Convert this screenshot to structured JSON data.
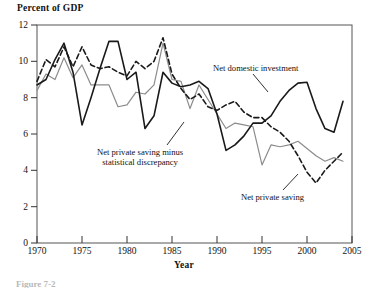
{
  "figure": {
    "caption_stub": "Figure 7-2"
  },
  "chart_data": {
    "type": "line",
    "title": "",
    "ylabel": "Percent of  GDP",
    "xlabel": "Year",
    "xlim": [
      1970,
      2005
    ],
    "ylim": [
      0,
      12
    ],
    "grid": false,
    "legend": "inline-annotations",
    "xticks": [
      "1970",
      "1975",
      "1980",
      "1985",
      "1990",
      "1995",
      "2000",
      "2005"
    ],
    "yticks": [
      "0",
      "2",
      "4",
      "6",
      "8",
      "10",
      "12"
    ],
    "x": [
      1970,
      1971,
      1972,
      1973,
      1974,
      1975,
      1976,
      1977,
      1978,
      1979,
      1980,
      1981,
      1982,
      1983,
      1984,
      1985,
      1986,
      1987,
      1988,
      1989,
      1990,
      1991,
      1992,
      1993,
      1994,
      1995,
      1996,
      1997,
      1998,
      1999,
      2000,
      2001,
      2002,
      2003,
      2004
    ],
    "series": [
      {
        "name": "Net domestic investment",
        "style": "solid",
        "color": "#1a1a1a",
        "width": 1.6,
        "annotation": "Net domestic investment",
        "values": [
          8.7,
          9.0,
          10.1,
          11.0,
          9.4,
          6.5,
          8.0,
          9.6,
          11.1,
          11.1,
          9.0,
          9.4,
          6.3,
          7.0,
          9.4,
          8.8,
          8.6,
          8.7,
          8.9,
          8.5,
          7.1,
          5.1,
          5.4,
          5.9,
          6.6,
          6.6,
          7.0,
          7.8,
          8.4,
          8.8,
          8.85,
          7.4,
          6.3,
          6.1,
          7.8
        ]
      },
      {
        "name": "Net private saving",
        "style": "dashed",
        "color": "#1a1a1a",
        "width": 1.6,
        "annotation": "Net private saving",
        "values": [
          8.9,
          10.1,
          9.7,
          10.8,
          9.7,
          10.8,
          9.8,
          9.6,
          9.7,
          9.4,
          9.2,
          10.0,
          9.6,
          10.0,
          11.3,
          9.3,
          8.5,
          7.9,
          8.2,
          7.5,
          7.3,
          7.6,
          7.8,
          7.2,
          6.9,
          6.9,
          6.4,
          6.1,
          5.6,
          4.8,
          3.9,
          3.3,
          4.0,
          4.5,
          5.0
        ]
      },
      {
        "name": "Net private saving minus statistical discrepancy",
        "style": "solid",
        "color": "#8c8c8c",
        "width": 1.2,
        "annotation": "Net private saving minus\nstatistical discrepancy",
        "values": [
          8.4,
          9.3,
          9.0,
          10.2,
          9.1,
          9.8,
          8.7,
          8.7,
          8.7,
          7.5,
          7.6,
          8.3,
          8.2,
          8.7,
          11.0,
          9.0,
          8.9,
          7.4,
          8.7,
          7.9,
          7.1,
          6.3,
          6.6,
          6.5,
          6.4,
          4.3,
          5.4,
          5.3,
          5.4,
          5.6,
          5.2,
          4.8,
          4.5,
          4.7,
          4.5
        ]
      }
    ],
    "annotations": [
      {
        "id": "net-domestic-investment",
        "text": "Net domestic investment",
        "lines": [
          "Net domestic investment"
        ]
      },
      {
        "id": "net-private-saving-minus-statistical-discrepancy",
        "text": "Net private saving minus statistical discrepancy",
        "lines": [
          "Net private saving minus",
          "statistical discrepancy"
        ]
      },
      {
        "id": "net-private-saving",
        "text": "Net private saving",
        "lines": [
          "Net private saving"
        ]
      }
    ]
  }
}
